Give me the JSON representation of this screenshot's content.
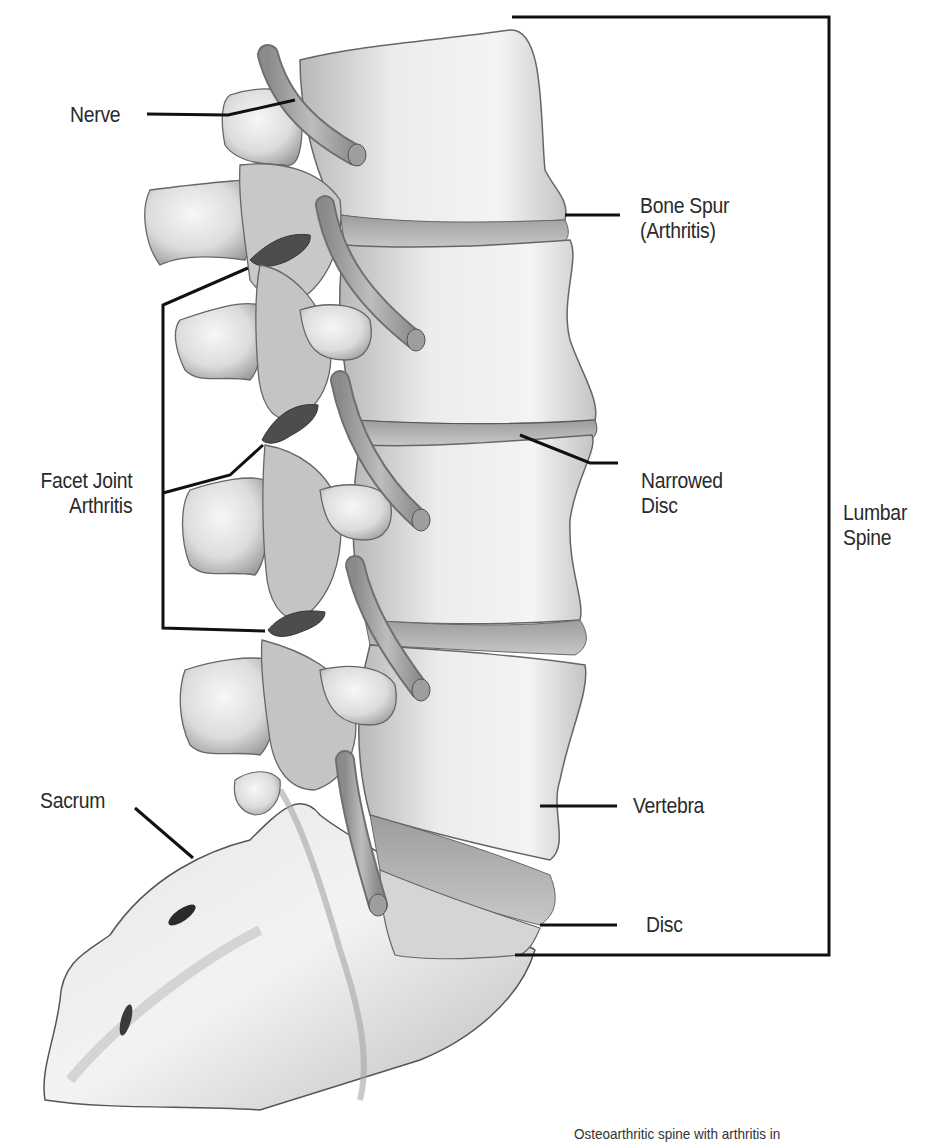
{
  "figure": {
    "type": "anatomical-illustration",
    "colors": {
      "background": "#ffffff",
      "bone_light": "#f2f2f2",
      "bone_mid": "#c9c9c9",
      "bone_dark": "#7a7a7a",
      "leader_line": "#111111",
      "label_text": "#2a2a2a"
    }
  },
  "labels": {
    "nerve": "Nerve",
    "bone_spur_line1": "Bone Spur",
    "bone_spur_line2": "(Arthritis)",
    "facet_joint_line1": "Facet Joint",
    "facet_joint_line2": "Arthritis",
    "narrowed_disc_line1": "Narrowed",
    "narrowed_disc_line2": "Disc",
    "lumbar_spine_line1": "Lumbar",
    "lumbar_spine_line2": "Spine",
    "vertebra": "Vertebra",
    "sacrum": "Sacrum",
    "disc": "Disc"
  },
  "caption": {
    "text": "Osteoarthritic spine with arthritis in"
  }
}
